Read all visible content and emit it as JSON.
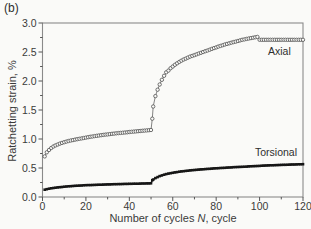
{
  "figure": {
    "panel_label": "(b)"
  },
  "colors": {
    "background": "#fafaf8",
    "frame": "#8a8a8a",
    "tick": "#555555",
    "text": "#3a3a3a",
    "axial": "#4f4f4f",
    "torsional": "#161616"
  },
  "chart_data": {
    "type": "line",
    "title": "",
    "xlabel": {
      "pre": "Number of cycles ",
      "var": "N",
      "post": ", cycle"
    },
    "ylabel": "Ratchetting strain, %",
    "xlim": [
      0,
      120
    ],
    "ylim": [
      0,
      3.0
    ],
    "grid": false,
    "legend_position": "inline-labels",
    "x_ticks": [
      {
        "v": 0,
        "label": "0"
      },
      {
        "v": 20,
        "label": "20"
      },
      {
        "v": 40,
        "label": "40"
      },
      {
        "v": 60,
        "label": "60"
      },
      {
        "v": 80,
        "label": "80"
      },
      {
        "v": 100,
        "label": "100"
      },
      {
        "v": 120,
        "label": "120"
      }
    ],
    "x_minor_ticks": [
      10,
      30,
      50,
      70,
      90,
      110
    ],
    "y_ticks": [
      {
        "v": 0.0,
        "label": "0.0"
      },
      {
        "v": 0.5,
        "label": "0.5"
      },
      {
        "v": 1.0,
        "label": "1.0"
      },
      {
        "v": 1.5,
        "label": "1.5"
      },
      {
        "v": 2.0,
        "label": "2.0"
      },
      {
        "v": 2.5,
        "label": "2.5"
      },
      {
        "v": 3.0,
        "label": "3.0"
      }
    ],
    "y_minor_ticks": [
      0.25,
      0.75,
      1.25,
      1.75,
      2.25,
      2.75
    ],
    "marker_every_cycles": 1,
    "series": [
      {
        "name": "Axial",
        "marker": "circle-open",
        "color": "#4f4f4f",
        "points": [
          [
            1,
            0.7
          ],
          [
            2,
            0.77
          ],
          [
            3,
            0.81
          ],
          [
            4,
            0.845
          ],
          [
            5,
            0.87
          ],
          [
            6,
            0.89
          ],
          [
            8,
            0.92
          ],
          [
            10,
            0.945
          ],
          [
            12,
            0.965
          ],
          [
            15,
            0.99
          ],
          [
            18,
            1.01
          ],
          [
            20,
            1.025
          ],
          [
            24,
            1.05
          ],
          [
            28,
            1.07
          ],
          [
            32,
            1.09
          ],
          [
            36,
            1.105
          ],
          [
            40,
            1.12
          ],
          [
            44,
            1.135
          ],
          [
            47,
            1.145
          ],
          [
            50,
            1.155
          ],
          [
            50.6,
            1.35
          ],
          [
            51,
            1.56
          ],
          [
            52,
            1.74
          ],
          [
            53,
            1.85
          ],
          [
            54,
            1.94
          ],
          [
            55,
            2.02
          ],
          [
            56,
            2.09
          ],
          [
            57,
            2.15
          ],
          [
            58,
            2.18
          ],
          [
            59,
            2.22
          ],
          [
            61,
            2.28
          ],
          [
            63,
            2.33
          ],
          [
            65,
            2.37
          ],
          [
            68,
            2.42
          ],
          [
            71,
            2.46
          ],
          [
            74,
            2.5
          ],
          [
            77,
            2.54
          ],
          [
            80,
            2.58
          ],
          [
            84,
            2.63
          ],
          [
            88,
            2.67
          ],
          [
            92,
            2.71
          ],
          [
            96,
            2.74
          ],
          [
            99,
            2.76
          ],
          [
            100,
            2.71
          ],
          [
            105,
            2.71
          ],
          [
            110,
            2.71
          ],
          [
            115,
            2.71
          ],
          [
            120,
            2.71
          ]
        ]
      },
      {
        "name": "Torsional",
        "marker": "square-filled",
        "color": "#161616",
        "points": [
          [
            1,
            0.125
          ],
          [
            2,
            0.135
          ],
          [
            3,
            0.143
          ],
          [
            5,
            0.156
          ],
          [
            7,
            0.165
          ],
          [
            10,
            0.177
          ],
          [
            13,
            0.187
          ],
          [
            16,
            0.195
          ],
          [
            20,
            0.203
          ],
          [
            24,
            0.209
          ],
          [
            28,
            0.214
          ],
          [
            32,
            0.219
          ],
          [
            36,
            0.223
          ],
          [
            40,
            0.227
          ],
          [
            44,
            0.23
          ],
          [
            47,
            0.233
          ],
          [
            50,
            0.236
          ],
          [
            50.6,
            0.29
          ],
          [
            51,
            0.3
          ],
          [
            52,
            0.325
          ],
          [
            54,
            0.36
          ],
          [
            56,
            0.385
          ],
          [
            58,
            0.403
          ],
          [
            60,
            0.418
          ],
          [
            63,
            0.436
          ],
          [
            66,
            0.45
          ],
          [
            69,
            0.462
          ],
          [
            72,
            0.472
          ],
          [
            76,
            0.484
          ],
          [
            80,
            0.495
          ],
          [
            84,
            0.504
          ],
          [
            88,
            0.513
          ],
          [
            92,
            0.521
          ],
          [
            96,
            0.529
          ],
          [
            100,
            0.537
          ],
          [
            105,
            0.546
          ],
          [
            110,
            0.553
          ],
          [
            115,
            0.56
          ],
          [
            120,
            0.565
          ]
        ]
      }
    ]
  }
}
